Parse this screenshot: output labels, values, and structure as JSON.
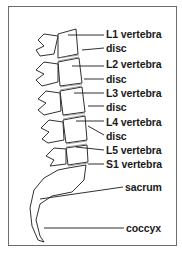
{
  "diagram": {
    "labels": [
      {
        "id": "l1",
        "text": "L1 vertebra",
        "x": 106,
        "y": 26
      },
      {
        "id": "disc1",
        "text": "disc",
        "x": 106,
        "y": 41
      },
      {
        "id": "l2",
        "text": "L2 vertebra",
        "x": 106,
        "y": 56
      },
      {
        "id": "disc2",
        "text": "disc",
        "x": 106,
        "y": 71
      },
      {
        "id": "l3",
        "text": "L3 vertebra",
        "x": 106,
        "y": 85
      },
      {
        "id": "disc3",
        "text": "disc",
        "x": 106,
        "y": 99
      },
      {
        "id": "l4",
        "text": "L4 vertebra",
        "x": 106,
        "y": 114
      },
      {
        "id": "disc4",
        "text": "disc",
        "x": 106,
        "y": 129
      },
      {
        "id": "l5",
        "text": "L5 vertebra",
        "x": 106,
        "y": 143
      },
      {
        "id": "s1",
        "text": "S1 vertebra",
        "x": 106,
        "y": 157
      },
      {
        "id": "sacrum",
        "text": "sacrum",
        "x": 125,
        "y": 181
      },
      {
        "id": "coccyx",
        "text": "coccyx",
        "x": 126,
        "y": 221
      }
    ],
    "colors": {
      "line": "#1a1a1a",
      "border": "#6d6d6d",
      "shade": "#9a9a9a"
    }
  }
}
